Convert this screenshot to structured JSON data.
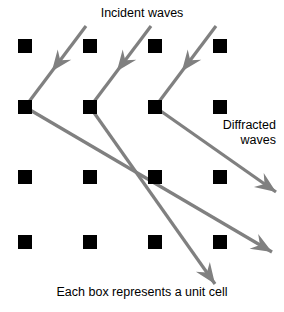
{
  "figure": {
    "width": 284,
    "height": 312,
    "background_color": "#ffffff"
  },
  "labels": {
    "incident": "Incident waves",
    "diffracted_line1": "Diffracted",
    "diffracted_line2": "waves",
    "caption": "Each box represents a unit cell"
  },
  "colors": {
    "unit_cell": "#000000",
    "ray": "#808080",
    "text": "#000000",
    "background": "#ffffff"
  },
  "lattice": {
    "description": "4 by 4 grid of black square unit cells",
    "rows": 4,
    "columns": 4,
    "square_size": 14,
    "column_x": [
      18,
      83,
      148,
      213
    ],
    "row_y": [
      39,
      100,
      170,
      235
    ]
  },
  "rays": {
    "stroke_width": 3.2,
    "incident": [
      {
        "name": "incident-ray-1",
        "x1": 86,
        "y1": 26,
        "x2": 25,
        "y2": 107,
        "arrow_t": 0.56
      },
      {
        "name": "incident-ray-2",
        "x1": 151,
        "y1": 26,
        "x2": 90,
        "y2": 107,
        "arrow_t": 0.56
      },
      {
        "name": "incident-ray-3",
        "x1": 216,
        "y1": 26,
        "x2": 155,
        "y2": 107,
        "arrow_t": 0.56
      }
    ],
    "diffracted": [
      {
        "name": "diffracted-ray-1",
        "x1": 25,
        "y1": 107,
        "x2": 272,
        "y2": 252,
        "arrow_t": 1.0
      },
      {
        "name": "diffracted-ray-2",
        "x1": 90,
        "y1": 107,
        "x2": 215,
        "y2": 284,
        "arrow_t": 1.0
      },
      {
        "name": "diffracted-ray-3",
        "x1": 155,
        "y1": 107,
        "x2": 276,
        "y2": 192,
        "arrow_t": 1.0
      }
    ]
  }
}
